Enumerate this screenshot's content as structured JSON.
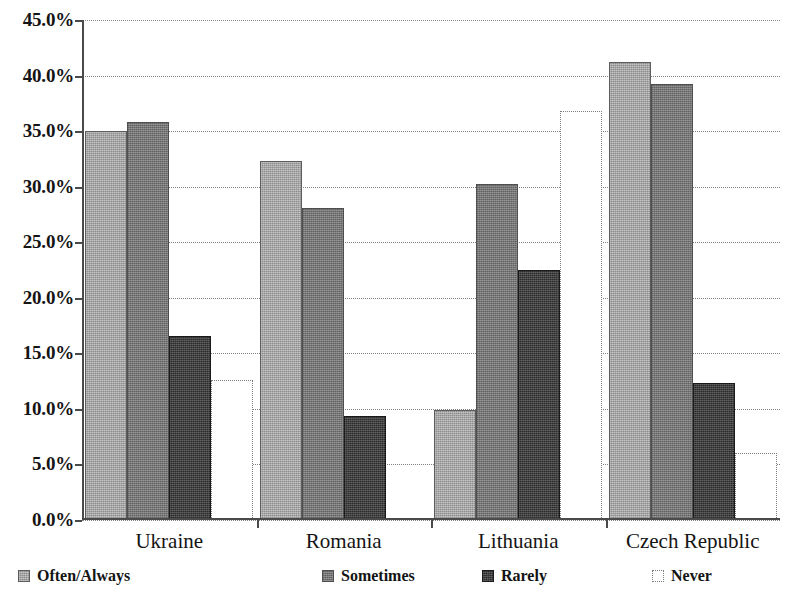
{
  "chart_data": {
    "type": "bar",
    "title": "",
    "subtitle": "",
    "xlabel": "",
    "ylabel": "",
    "categories": [
      "Ukraine",
      "Romania",
      "Lithuania",
      "Czech Republic"
    ],
    "series": [
      {
        "name": "Often/Always",
        "values": [
          35.0,
          32.3,
          9.9,
          41.2
        ],
        "color": "#8d8d8d"
      },
      {
        "name": "Sometimes",
        "values": [
          35.8,
          28.1,
          30.2,
          39.2
        ],
        "color": "#767676"
      },
      {
        "name": "Rarely",
        "values": [
          16.6,
          9.4,
          22.5,
          12.3
        ],
        "color": "#2b2b2b"
      },
      {
        "name": "Never",
        "values": [
          12.6,
          0.0,
          36.8,
          6.0
        ],
        "color": "#ffffff"
      }
    ],
    "ylim": [
      0,
      45
    ],
    "ytick_values": [
      0,
      5,
      10,
      15,
      20,
      25,
      30,
      35,
      40,
      45
    ],
    "ytick_labels": [
      "0.0%",
      "5.0%",
      "10.0%",
      "15.0%",
      "20.0%",
      "25.0%",
      "30.0%",
      "35.0%",
      "40.0%",
      "45.0%"
    ],
    "yunit": "%",
    "grid": true,
    "grid_axis": "y",
    "legend_position": "bottom",
    "legend_entries": [
      "Often/Always",
      "Sometimes",
      "Rarely",
      "Never"
    ]
  },
  "axis": {
    "y_tick_labels": [
      "45.0%",
      "40.0%",
      "35.0%",
      "30.0%",
      "25.0%",
      "20.0%",
      "15.0%",
      "10.0%",
      "5.0%",
      "0.0%"
    ],
    "x_tick_labels": [
      "Ukraine",
      "Romania",
      "Lithuania",
      "Czech Republic"
    ]
  },
  "legend": {
    "items": [
      {
        "label": "Often/Always",
        "swatch": "swatch-often-always"
      },
      {
        "label": "Sometimes",
        "swatch": "swatch-sometimes"
      },
      {
        "label": "Rarely",
        "swatch": "swatch-rarely"
      },
      {
        "label": "Never",
        "swatch": "swatch-never"
      }
    ]
  }
}
